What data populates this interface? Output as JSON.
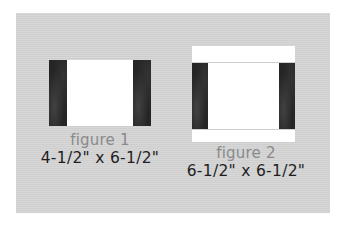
{
  "colors": {
    "background": "#ffffff",
    "panel": "#d3d3d3",
    "fabric_dark": "#252525",
    "block_white": "#ffffff",
    "label_grey": "#8a8a8a",
    "size_text": "#1e1e1e"
  },
  "figures": [
    {
      "label": "figure 1",
      "size": "4-1/2\" x 6-1/2\"",
      "parts": [
        "dark fabric strip",
        "white center",
        "dark fabric strip"
      ]
    },
    {
      "label": "figure 2",
      "size": "6-1/2\" x 6-1/2\"",
      "parts": [
        "white top strip",
        "dark fabric strip",
        "white center",
        "dark fabric strip",
        "white bottom strip"
      ]
    }
  ]
}
